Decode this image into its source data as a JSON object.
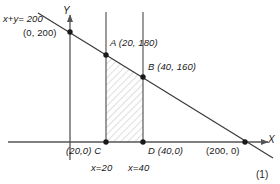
{
  "figure": {
    "caption": "(1)",
    "axes": {
      "x_label": "X",
      "y_label": "Y"
    },
    "line_equation_label": "x+y= 200",
    "colors": {
      "stroke": "#3a3a3a",
      "axis": "#555555",
      "hatch": "#bdbdbd",
      "point": "#1a1a1a",
      "text": "#1a1a1a",
      "background": "#ffffff"
    },
    "points": [
      {
        "id": "y-intercept",
        "label": "(0, 200)",
        "x": 0,
        "y": 200
      },
      {
        "id": "A",
        "label": "A (20, 180)",
        "name": "A",
        "x": 20,
        "y": 180
      },
      {
        "id": "B",
        "label": "B (40, 160)",
        "name": "B",
        "x": 40,
        "y": 160
      },
      {
        "id": "C",
        "label": "(20,0) C",
        "name": "C",
        "x": 20,
        "y": 0
      },
      {
        "id": "D",
        "label": "D (40,0)",
        "name": "D",
        "x": 40,
        "y": 0
      },
      {
        "id": "x-intercept",
        "label": "(200, 0)",
        "x": 200,
        "y": 0
      }
    ],
    "vertical_lines": [
      {
        "id": "x20",
        "label": "x=20",
        "value": 20
      },
      {
        "id": "x40",
        "label": "x=40",
        "value": 40
      }
    ],
    "shaded_region": {
      "description": "region bounded by x=20, x=40, X-axis and line x+y=200",
      "vertices": [
        "C (20,0)",
        "A (20,180)",
        "B (40,160)",
        "D (40,0)"
      ]
    }
  }
}
